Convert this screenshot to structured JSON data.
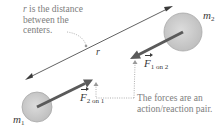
{
  "diagram": {
    "caption_distance": {
      "lines": [
        "r is the distance",
        "between the",
        "centers."
      ],
      "r_symbol": "r"
    },
    "distance_label": "r",
    "mass_1": {
      "symbol": "m",
      "subscript": "1"
    },
    "mass_2": {
      "symbol": "m",
      "subscript": "2"
    },
    "force_2_on_1": {
      "symbol": "F",
      "subscript": "2 on 1"
    },
    "force_1_on_2": {
      "symbol": "F",
      "subscript": "1 on 2"
    },
    "caption_forces": {
      "lines": [
        "The forces are an",
        "action/reaction pair."
      ]
    },
    "colors": {
      "sphere_fill": "#c8c8c8",
      "sphere_edge": "#9a9a9a",
      "arrow": "#5a5a5a",
      "line": "#3a3a3a",
      "caption_text": "#7d7d7d"
    }
  }
}
